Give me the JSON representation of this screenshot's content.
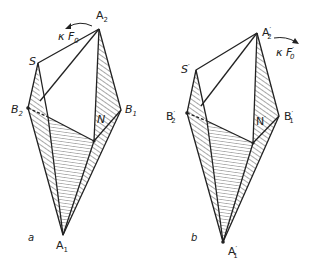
{
  "figures": [
    {
      "id": "a",
      "caption": "a",
      "labels": {
        "A2": "A",
        "A2_sub": "2",
        "S": "S",
        "B2": "B",
        "B2_sub": "2",
        "B1": "B",
        "B1_sub": "1",
        "N": "N",
        "A1": "A",
        "A1_sub": "1",
        "kappa": "κ",
        "F0": "F",
        "F0_sub": "0"
      },
      "vertices": {
        "A2": [
          99,
          29
        ],
        "S": [
          38,
          63
        ],
        "B2": [
          28,
          108
        ],
        "B1": [
          121,
          110
        ],
        "N": [
          94,
          141
        ],
        "A1": [
          63,
          235
        ],
        "inner": [
          40,
          101
        ],
        "M": [
          48,
          117
        ]
      }
    },
    {
      "id": "b",
      "caption": "b",
      "labels": {
        "A2": "A",
        "A2_sub": "2",
        "A2_prime": "′",
        "S": "S",
        "S_prime": "′",
        "B2": "B",
        "B2_sub": "2",
        "B2_prime": "′",
        "B1": "B",
        "B1_sub": "1",
        "B1_prime": "′",
        "N": "N",
        "N_prime": "′",
        "A1": "A",
        "A1_sub": "1",
        "A1_prime": "′",
        "kappa": "κ",
        "F0": "F",
        "F0_sub": "0",
        "F0_prime": "′"
      },
      "vertices": {
        "A2": [
          257,
          33
        ],
        "S": [
          196,
          70
        ],
        "B2": [
          187,
          113
        ],
        "B1": [
          279,
          116
        ],
        "N": [
          253,
          143
        ],
        "A1": [
          223,
          242
        ],
        "inner": [
          201,
          106
        ],
        "M": [
          207,
          121
        ]
      }
    }
  ],
  "colors": {
    "ink": "#222222",
    "paper": "#ffffff"
  }
}
